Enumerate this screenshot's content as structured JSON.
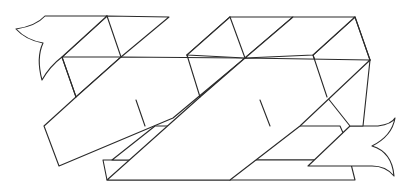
{
  "diagram": {
    "title": "",
    "stroke_color": "#2a2a2a",
    "background_color": "#ffffff",
    "parts": [
      {
        "name": "left-tail",
        "label": ""
      },
      {
        "name": "ribbon-strip-1",
        "label": ""
      },
      {
        "name": "ribbon-strip-2",
        "label": ""
      },
      {
        "name": "ribbon-strip-3",
        "label": ""
      },
      {
        "name": "right-tail",
        "label": ""
      }
    ]
  }
}
